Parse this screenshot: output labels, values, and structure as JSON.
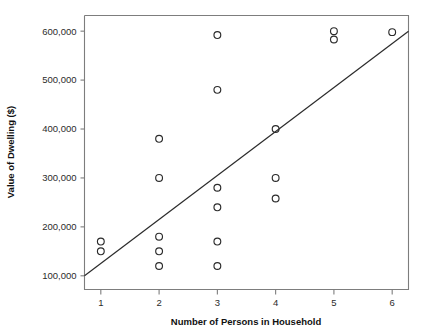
{
  "chart_data": {
    "type": "scatter",
    "title": "",
    "xlabel": "Number of Persons in Household",
    "ylabel": "Value of Dwelling ($)",
    "xlim": [
      0.72,
      6.28
    ],
    "ylim": [
      72000,
      632000
    ],
    "grid": false,
    "legend": null,
    "xticks": [
      1,
      2,
      3,
      4,
      5,
      6
    ],
    "xtick_labels": [
      "1",
      "2",
      "3",
      "4",
      "5",
      "6"
    ],
    "yticks": [
      100000,
      200000,
      300000,
      400000,
      500000,
      600000
    ],
    "ytick_labels": [
      "100,000",
      "200,000",
      "300,000",
      "400,000",
      "500,000",
      "600,000"
    ],
    "marker": "open-circle",
    "points": [
      {
        "x": 1,
        "y": 170000
      },
      {
        "x": 1,
        "y": 150000
      },
      {
        "x": 2,
        "y": 380000
      },
      {
        "x": 2,
        "y": 300000
      },
      {
        "x": 2,
        "y": 180000
      },
      {
        "x": 2,
        "y": 150000
      },
      {
        "x": 2,
        "y": 120000
      },
      {
        "x": 3,
        "y": 592000
      },
      {
        "x": 3,
        "y": 480000
      },
      {
        "x": 3,
        "y": 280000
      },
      {
        "x": 3,
        "y": 240000
      },
      {
        "x": 3,
        "y": 170000
      },
      {
        "x": 3,
        "y": 120000
      },
      {
        "x": 4,
        "y": 400000
      },
      {
        "x": 4,
        "y": 300000
      },
      {
        "x": 4,
        "y": 258000
      },
      {
        "x": 5,
        "y": 600000
      },
      {
        "x": 5,
        "y": 583000
      },
      {
        "x": 6,
        "y": 598000
      }
    ],
    "fit_line": {
      "type": "linear-regression",
      "x_start": 0.72,
      "y_start": 100000,
      "x_end": 6.28,
      "y_end": 600000
    },
    "colors": {
      "marker_stroke": "#2b2b2b",
      "fit_line": "#2b2b2b",
      "axis": "#7d7d7d",
      "text": "#111111",
      "background": "#ffffff"
    }
  }
}
